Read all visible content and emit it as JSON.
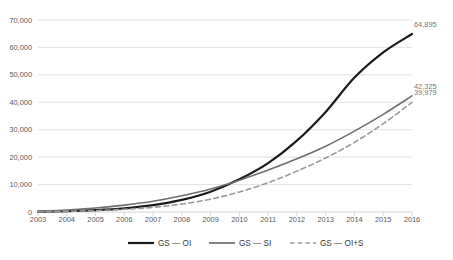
{
  "chart_data": {
    "type": "line",
    "title": "",
    "subtitle": "",
    "xlabel": "",
    "ylabel": "",
    "categories": [
      "2003",
      "2004",
      "2005",
      "2006",
      "2007",
      "2008",
      "2009",
      "2010",
      "2011",
      "2012",
      "2013",
      "2014",
      "2015",
      "2016"
    ],
    "ylim": [
      0,
      70000
    ],
    "y_ticks": [
      0,
      10000,
      20000,
      30000,
      40000,
      50000,
      60000,
      70000
    ],
    "y_tick_labels": [
      "0",
      "10,000",
      "20,000",
      "30,000",
      "40,000",
      "50,000",
      "60,000",
      "70,000"
    ],
    "grid": true,
    "legend_position": "bottom",
    "series": [
      {
        "name": "GS — OI",
        "style": "solid",
        "color": "#1a1a1a",
        "width": 2.2,
        "values": [
          120,
          330,
          700,
          1350,
          2500,
          4400,
          7400,
          11900,
          17800,
          26000,
          36500,
          49000,
          58200,
          64895
        ],
        "end_label": "64,895"
      },
      {
        "name": "GS — SI",
        "style": "solid",
        "color": "#6e6e6e",
        "width": 1.6,
        "values": [
          250,
          700,
          1450,
          2500,
          3900,
          5900,
          8400,
          11600,
          15300,
          19400,
          24000,
          29500,
          35600,
          42325
        ],
        "end_label": "42,325"
      },
      {
        "name": "GS — OI+S",
        "style": "dashed",
        "color": "#9a9a9a",
        "width": 1.6,
        "values": [
          90,
          250,
          520,
          980,
          1700,
          2900,
          4700,
          7300,
          10700,
          14900,
          19700,
          25400,
          32200,
          39979
        ],
        "end_label": "39,979"
      }
    ],
    "point_labels": [
      {
        "text": "64,895",
        "series": "GS — OI"
      },
      {
        "text": "42,325",
        "series": "GS — SI"
      },
      {
        "text": "39,979",
        "series": "GS — OI+S"
      }
    ]
  },
  "legend": {
    "items": [
      {
        "label": "GS — OI",
        "style": "solid",
        "color": "#1a1a1a"
      },
      {
        "label": "GS — SI",
        "style": "solid",
        "color": "#6e6e6e"
      },
      {
        "label": "GS — OI+S",
        "style": "dashed",
        "color": "#9a9a9a"
      }
    ]
  },
  "colors": {
    "grid": "#d6d6d6",
    "axis": "#c9c9c9",
    "tick_text": "#5a5a5a",
    "label_text": "#777777",
    "background": "#ffffff"
  }
}
